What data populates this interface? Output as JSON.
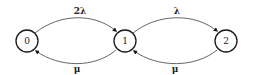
{
  "diagram": {
    "type": "state-transition",
    "nodes": [
      {
        "id": "0",
        "label": "0",
        "cx": 27,
        "cy": 41,
        "r": 11
      },
      {
        "id": "1",
        "label": "1",
        "cx": 125,
        "cy": 41,
        "r": 11
      },
      {
        "id": "2",
        "label": "2",
        "cx": 226,
        "cy": 41,
        "r": 11
      }
    ],
    "edges": [
      {
        "from": "0",
        "to": "1",
        "label": "2λ",
        "position": "upper"
      },
      {
        "from": "1",
        "to": "0",
        "label": "μ",
        "position": "lower"
      },
      {
        "from": "1",
        "to": "2",
        "label": "λ",
        "position": "upper"
      },
      {
        "from": "2",
        "to": "1",
        "label": "μ",
        "position": "lower"
      }
    ],
    "colors": {
      "node_stroke": "#1a1a1a",
      "edge_stroke": "#555555",
      "background": "#ffffff"
    }
  }
}
